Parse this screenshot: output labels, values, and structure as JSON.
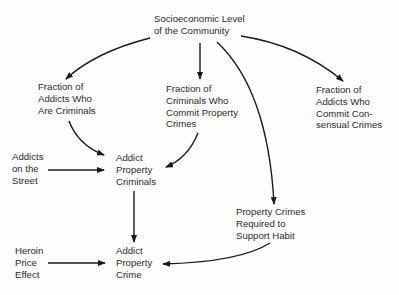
{
  "diagram": {
    "type": "causal-flow",
    "nodes": {
      "socioeconomic": {
        "lines": [
          "Socioeconomic Level",
          "of the Community"
        ]
      },
      "frac_addicts_criminals": {
        "lines": [
          "Fraction of",
          "Addicts Who",
          "Are Criminals"
        ]
      },
      "frac_criminals_property": {
        "lines": [
          "Fraction of",
          "Criminals Who",
          "Commit Property",
          "Crimes"
        ]
      },
      "frac_addicts_consensual": {
        "lines": [
          "Fraction of",
          "Addicts Who",
          "Commit Con-",
          "sensual Crimes"
        ]
      },
      "addicts_street": {
        "lines": [
          "Addicts",
          "on the",
          "Street"
        ]
      },
      "addict_property_criminals": {
        "lines": [
          "Addict",
          "Property",
          "Criminals"
        ]
      },
      "property_crimes_required": {
        "lines": [
          "Property Crimes",
          "Required to",
          "Support Habit"
        ]
      },
      "heroin_price": {
        "lines": [
          "Heroin",
          "Price",
          "Effect"
        ]
      },
      "addict_property_crime": {
        "lines": [
          "Addict",
          "Property",
          "Crime"
        ]
      }
    },
    "edges": [
      {
        "from": "Socioeconomic Level of the Community",
        "to": "Fraction of Addicts Who Are Criminals"
      },
      {
        "from": "Socioeconomic Level of the Community",
        "to": "Fraction of Criminals Who Commit Property Crimes"
      },
      {
        "from": "Socioeconomic Level of the Community",
        "to": "Property Crimes Required to Support Habit"
      },
      {
        "from": "Socioeconomic Level of the Community",
        "to": "Fraction of Addicts Who Commit Consensual Crimes"
      },
      {
        "from": "Fraction of Addicts Who Are Criminals",
        "to": "Addict Property Criminals"
      },
      {
        "from": "Fraction of Criminals Who Commit Property Crimes",
        "to": "Addict Property Criminals"
      },
      {
        "from": "Addicts on the Street",
        "to": "Addict Property Criminals"
      },
      {
        "from": "Addict Property Criminals",
        "to": "Addict Property Crime"
      },
      {
        "from": "Heroin Price Effect",
        "to": "Addict Property Crime"
      },
      {
        "from": "Property Crimes Required to Support Habit",
        "to": "Addict Property Crime"
      }
    ],
    "colors": {
      "ink": "#1a1a1a",
      "background": "#fdfdfd"
    }
  }
}
